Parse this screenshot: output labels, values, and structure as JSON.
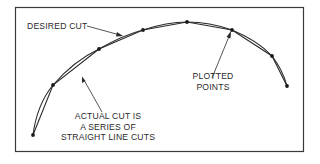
{
  "figure": {
    "labels": {
      "desired_cut": "DESIRED CUT",
      "plotted_points": [
        "PLOTTED",
        "POINTS"
      ],
      "actual_cut": [
        "ACTUAL CUT IS",
        "A SERIES OF",
        "STRAIGHT LINE CUTS"
      ]
    },
    "colors": {
      "line": "#2a2a2a",
      "frame": "#3a3a3a",
      "background": "#ffffff"
    },
    "plotted_points": [
      [
        33,
        135
      ],
      [
        53,
        85
      ],
      [
        99,
        49
      ],
      [
        143,
        30
      ],
      [
        187,
        22
      ],
      [
        232,
        30
      ],
      [
        272,
        56
      ],
      [
        287,
        86
      ]
    ]
  }
}
